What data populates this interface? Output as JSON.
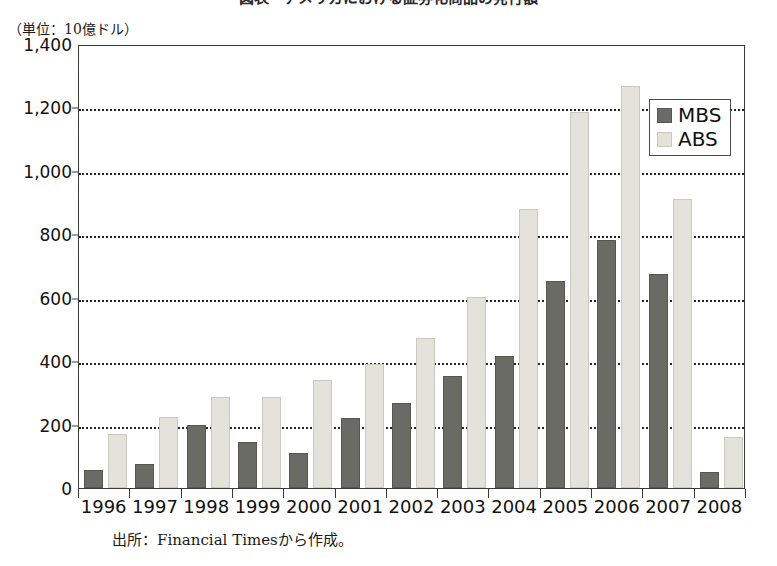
{
  "chart_data": {
    "type": "bar",
    "title": "図表　アメリカにおける証券化商品の発行額",
    "subtitle": "（単位：10億ドル）",
    "unit_label": "（単位：10億ドル）",
    "source_note": "出所：Financial Timesから作成。",
    "xlabel": "",
    "ylabel": "",
    "ylim": [
      0,
      1400
    ],
    "y_ticks": [
      0,
      200,
      400,
      600,
      800,
      1000,
      1200,
      1400
    ],
    "y_tick_labels": [
      "0",
      "200",
      "400",
      "600",
      "800",
      "1,000",
      "1,200",
      "1,400"
    ],
    "grid": true,
    "grid_style": "dotted-horizontal",
    "legend_position": "top-right",
    "categories": [
      "1996",
      "1997",
      "1998",
      "1999",
      "2000",
      "2001",
      "2002",
      "2003",
      "2004",
      "2005",
      "2006",
      "2007",
      "2008"
    ],
    "series": [
      {
        "name": "MBS",
        "color": "#6b6b66",
        "values": [
          50,
          70,
          192,
          140,
          105,
          215,
          262,
          348,
          410,
          645,
          775,
          670,
          45
        ]
      },
      {
        "name": "ABS",
        "color": "#e3e3dc",
        "values": [
          165,
          218,
          280,
          280,
          335,
          385,
          468,
          595,
          875,
          1180,
          1262,
          905,
          155
        ]
      }
    ]
  }
}
